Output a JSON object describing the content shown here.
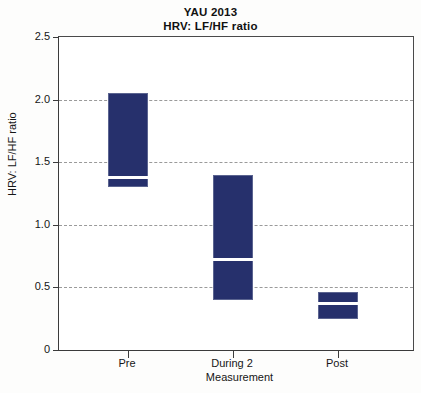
{
  "chart_data": {
    "type": "bar",
    "title": "YAU 2013",
    "subtitle": "HRV: LF/HF ratio",
    "xlabel": "Measurement",
    "ylabel": "HRV: LF/HF ratio",
    "ylim": [
      0,
      2.5
    ],
    "yticks": [
      "0",
      "0.5",
      "1.0",
      "1.5",
      "2.0",
      "2.5"
    ],
    "ytick_values": [
      0,
      0.5,
      1.0,
      1.5,
      2.0,
      2.5
    ],
    "grid": "horizontal-dashed",
    "legend": "none",
    "bar_color": "#26306c",
    "median_color": "#ffffff",
    "grid_color": "#9a9a9a",
    "axis_color": "#3b3b3b",
    "categories": [
      "Pre",
      "During 2",
      "Post"
    ],
    "series": [
      {
        "name": "HRV: LF/HF ratio",
        "upper": [
          2.05,
          1.4,
          0.46
        ],
        "lower": [
          1.3,
          0.4,
          0.25
        ],
        "median": [
          1.38,
          0.72,
          0.37
        ]
      }
    ]
  },
  "axis": {
    "y_tick_labels": [
      "2.5",
      "2.0",
      "1.5",
      "1.0",
      "0.5",
      "0"
    ],
    "x_tick_labels": [
      "Pre",
      "During 2",
      "Post"
    ]
  }
}
